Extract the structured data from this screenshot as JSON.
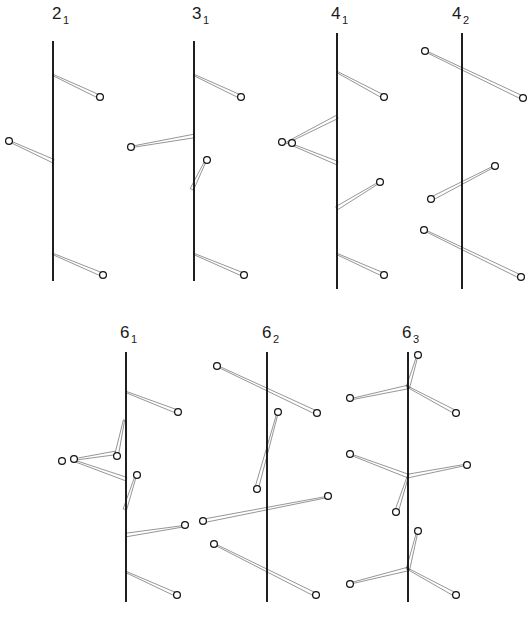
{
  "figure": {
    "background_color": "#ffffff",
    "ink_color": "#141414",
    "node_fill_color": "#ffffff",
    "width": 532,
    "height": 626,
    "node_radius": 3.4,
    "branch_thin_width": 1.3,
    "branch_thick_width": 3.6
  },
  "diagrams": [
    {
      "id": "d21",
      "label_main": "2",
      "label_sub": "1",
      "label_x": 52,
      "label_y": 19,
      "axis": {
        "x": 53,
        "y1": 41,
        "y2": 281
      },
      "branches": [
        {
          "name": "branch-upper-right",
          "x1": 53,
          "y1": 75,
          "x2": 100,
          "y2": 97,
          "taper": "out"
        },
        {
          "name": "branch-middle-left",
          "x1": 53,
          "y1": 161,
          "x2": 9,
          "y2": 141,
          "taper": "in"
        },
        {
          "name": "branch-lower-right",
          "x1": 53,
          "y1": 254,
          "x2": 103,
          "y2": 275,
          "taper": "out"
        }
      ],
      "nodes": [
        {
          "name": "node-upper-right",
          "x": 100,
          "y": 97
        },
        {
          "name": "node-middle-left",
          "x": 9,
          "y": 141
        },
        {
          "name": "node-lower-right",
          "x": 103,
          "y": 275
        }
      ]
    },
    {
      "id": "d31",
      "label_main": "3",
      "label_sub": "1",
      "label_x": 192,
      "label_y": 19,
      "axis": {
        "x": 194,
        "y1": 41,
        "y2": 281
      },
      "branches": [
        {
          "name": "branch-upper-right",
          "x1": 194,
          "y1": 75,
          "x2": 241,
          "y2": 97,
          "taper": "out"
        },
        {
          "name": "branch-middle-left",
          "x1": 194,
          "y1": 136,
          "x2": 131,
          "y2": 147,
          "taper": "in"
        },
        {
          "name": "branch-short-right",
          "x1": 192,
          "y1": 189,
          "x2": 206,
          "y2": 160,
          "taper": "in"
        },
        {
          "name": "branch-lower-right",
          "x1": 194,
          "y1": 254,
          "x2": 244,
          "y2": 275,
          "taper": "out"
        }
      ],
      "nodes": [
        {
          "name": "node-upper-right",
          "x": 241,
          "y": 97
        },
        {
          "name": "node-middle-left",
          "x": 131,
          "y": 147
        },
        {
          "name": "node-short-right",
          "x": 207,
          "y": 160
        },
        {
          "name": "node-lower-right",
          "x": 244,
          "y": 275
        }
      ]
    },
    {
      "id": "d41",
      "label_main": "4",
      "label_sub": "1",
      "label_x": 331,
      "label_y": 19,
      "axis": {
        "x": 337,
        "y1": 33,
        "y2": 289
      },
      "branches": [
        {
          "name": "branch-upper-right",
          "x1": 337,
          "y1": 72,
          "x2": 384,
          "y2": 97,
          "taper": "out"
        },
        {
          "name": "branch-triangle-upper",
          "x1": 337,
          "y1": 117,
          "x2": 286,
          "y2": 143,
          "taper": "in"
        },
        {
          "name": "branch-triangle-lower",
          "x1": 337,
          "y1": 163,
          "x2": 288,
          "y2": 143,
          "taper": "in"
        },
        {
          "name": "branch-mid-right",
          "x1": 337,
          "y1": 208,
          "x2": 380,
          "y2": 182,
          "taper": "in"
        },
        {
          "name": "branch-lower-right",
          "x1": 337,
          "y1": 254,
          "x2": 384,
          "y2": 275,
          "taper": "out"
        }
      ],
      "nodes": [
        {
          "name": "node-upper-right",
          "x": 384,
          "y": 97
        },
        {
          "name": "node-triangle-apex-outer",
          "x": 282,
          "y": 142
        },
        {
          "name": "node-triangle-apex-inner",
          "x": 292,
          "y": 143
        },
        {
          "name": "node-mid-right",
          "x": 380,
          "y": 182
        },
        {
          "name": "node-lower-right",
          "x": 384,
          "y": 275
        }
      ]
    },
    {
      "id": "d42",
      "label_main": "4",
      "label_sub": "2",
      "label_x": 452,
      "label_y": 19,
      "axis": {
        "x": 462,
        "y1": 33,
        "y2": 289
      },
      "branches": [
        {
          "name": "branch-top-crossing",
          "x1": 425,
          "y1": 51,
          "x2": 523,
          "y2": 98,
          "taper": "out"
        },
        {
          "name": "branch-mid-crossing",
          "x1": 495,
          "y1": 166,
          "x2": 431,
          "y2": 199,
          "taper": "out"
        },
        {
          "name": "branch-lower-crossing",
          "x1": 424,
          "y1": 230,
          "x2": 521,
          "y2": 277,
          "taper": "out"
        }
      ],
      "nodes": [
        {
          "name": "node-top-left",
          "x": 425,
          "y": 51
        },
        {
          "name": "node-top-right",
          "x": 523,
          "y": 98
        },
        {
          "name": "node-mid-right",
          "x": 495,
          "y": 166
        },
        {
          "name": "node-mid-left",
          "x": 431,
          "y": 199
        },
        {
          "name": "node-lower-left",
          "x": 424,
          "y": 230
        },
        {
          "name": "node-lower-right",
          "x": 521,
          "y": 277
        }
      ]
    },
    {
      "id": "d61",
      "label_main": "6",
      "label_sub": "1",
      "label_x": 120,
      "label_y": 338,
      "axis": {
        "x": 126,
        "y1": 352,
        "y2": 602
      },
      "branches": [
        {
          "name": "branch-upper-right",
          "x1": 126,
          "y1": 392,
          "x2": 178,
          "y2": 412,
          "taper": "out"
        },
        {
          "name": "branch-spike-up",
          "x1": 117,
          "y1": 453,
          "x2": 124,
          "y2": 420,
          "taper": "in"
        },
        {
          "name": "branch-triangle-upper",
          "x1": 115,
          "y1": 453,
          "x2": 71,
          "y2": 460,
          "taper": "in"
        },
        {
          "name": "branch-triangle-lower",
          "x1": 126,
          "y1": 479,
          "x2": 72,
          "y2": 460,
          "taper": "in"
        },
        {
          "name": "branch-spike-down",
          "x1": 125,
          "y1": 509,
          "x2": 136,
          "y2": 475,
          "taper": "in"
        },
        {
          "name": "branch-long-right",
          "x1": 126,
          "y1": 535,
          "x2": 185,
          "y2": 526,
          "taper": "in"
        },
        {
          "name": "branch-lower-right",
          "x1": 126,
          "y1": 572,
          "x2": 177,
          "y2": 595,
          "taper": "out"
        }
      ],
      "nodes": [
        {
          "name": "node-upper-right",
          "x": 178,
          "y": 412
        },
        {
          "name": "node-spike-up",
          "x": 117,
          "y": 456
        },
        {
          "name": "node-triangle-apex-inner",
          "x": 74,
          "y": 459
        },
        {
          "name": "node-triangle-apex-outer",
          "x": 62,
          "y": 461
        },
        {
          "name": "node-spike-down",
          "x": 137,
          "y": 475
        },
        {
          "name": "node-long-right",
          "x": 185,
          "y": 525
        },
        {
          "name": "node-lower-right",
          "x": 177,
          "y": 595
        }
      ]
    },
    {
      "id": "d62",
      "label_main": "6",
      "label_sub": "2",
      "label_x": 262,
      "label_y": 338,
      "axis": {
        "x": 267,
        "y1": 352,
        "y2": 602
      },
      "branches": [
        {
          "name": "branch-top-crossing",
          "x1": 217,
          "y1": 366,
          "x2": 317,
          "y2": 413,
          "taper": "out"
        },
        {
          "name": "branch-spike",
          "x1": 257,
          "y1": 487,
          "x2": 277,
          "y2": 415,
          "taper": "in"
        },
        {
          "name": "branch-mid-crossing",
          "x1": 327,
          "y1": 497,
          "x2": 203,
          "y2": 521,
          "taper": "out"
        },
        {
          "name": "branch-lower-crossing",
          "x1": 214,
          "y1": 544,
          "x2": 316,
          "y2": 595,
          "taper": "out"
        }
      ],
      "nodes": [
        {
          "name": "node-top-left",
          "x": 217,
          "y": 366
        },
        {
          "name": "node-top-right",
          "x": 317,
          "y": 413
        },
        {
          "name": "node-spike-top",
          "x": 278,
          "y": 412
        },
        {
          "name": "node-spike-bottom",
          "x": 257,
          "y": 489
        },
        {
          "name": "node-mid-right",
          "x": 328,
          "y": 496
        },
        {
          "name": "node-mid-left",
          "x": 203,
          "y": 521
        },
        {
          "name": "node-lower-left",
          "x": 214,
          "y": 544
        },
        {
          "name": "node-lower-right",
          "x": 316,
          "y": 595
        }
      ]
    },
    {
      "id": "d63",
      "label_main": "6",
      "label_sub": "3",
      "label_x": 402,
      "label_y": 338,
      "axis": {
        "x": 408,
        "y1": 352,
        "y2": 602
      },
      "branches": [
        {
          "name": "branch-n1-up",
          "x1": 408,
          "y1": 387,
          "x2": 417,
          "y2": 357,
          "taper": "in"
        },
        {
          "name": "branch-n1-left",
          "x1": 408,
          "y1": 387,
          "x2": 352,
          "y2": 399,
          "taper": "in"
        },
        {
          "name": "branch-n1-right",
          "x1": 408,
          "y1": 387,
          "x2": 455,
          "y2": 412,
          "taper": "out"
        },
        {
          "name": "branch-n2-left",
          "x1": 408,
          "y1": 476,
          "x2": 352,
          "y2": 455,
          "taper": "in"
        },
        {
          "name": "branch-n2-right",
          "x1": 408,
          "y1": 476,
          "x2": 465,
          "y2": 465,
          "taper": "in"
        },
        {
          "name": "branch-n2-down",
          "x1": 408,
          "y1": 476,
          "x2": 397,
          "y2": 510,
          "taper": "out"
        },
        {
          "name": "branch-n3-up",
          "x1": 408,
          "y1": 569,
          "x2": 417,
          "y2": 533,
          "taper": "in"
        },
        {
          "name": "branch-n3-left",
          "x1": 408,
          "y1": 569,
          "x2": 352,
          "y2": 583,
          "taper": "in"
        },
        {
          "name": "branch-n3-right",
          "x1": 408,
          "y1": 569,
          "x2": 454,
          "y2": 594,
          "taper": "out"
        }
      ],
      "nodes": [
        {
          "name": "node-n1-up",
          "x": 418,
          "y": 355
        },
        {
          "name": "node-n1-left",
          "x": 350,
          "y": 398
        },
        {
          "name": "node-n1-right",
          "x": 456,
          "y": 413
        },
        {
          "name": "node-n2-left",
          "x": 350,
          "y": 454
        },
        {
          "name": "node-n2-right",
          "x": 467,
          "y": 465
        },
        {
          "name": "node-n2-down",
          "x": 396,
          "y": 512
        },
        {
          "name": "node-n3-up",
          "x": 418,
          "y": 531
        },
        {
          "name": "node-n3-left",
          "x": 350,
          "y": 584
        },
        {
          "name": "node-n3-right",
          "x": 456,
          "y": 595
        }
      ]
    }
  ]
}
